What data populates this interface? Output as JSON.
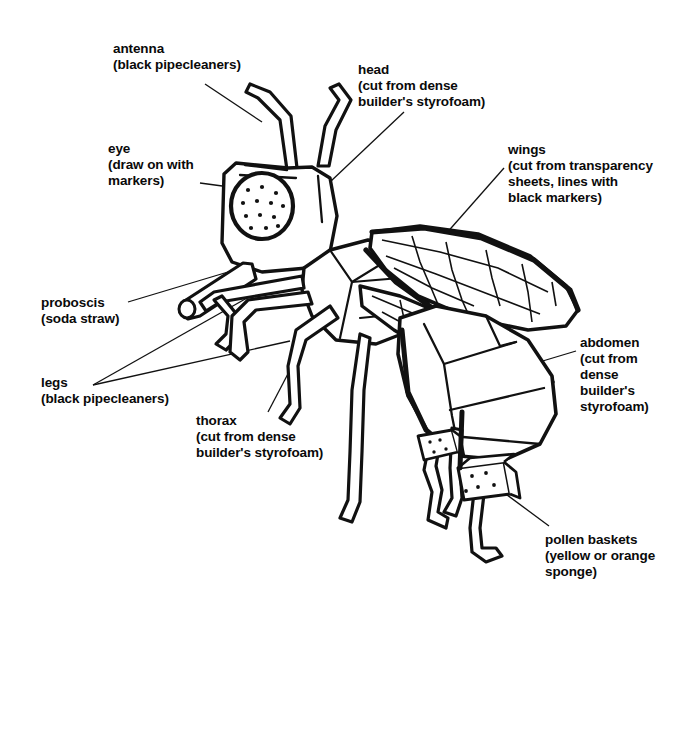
{
  "page": {
    "background_color": "#ffffff",
    "ink_color": "#111111"
  },
  "labels": [
    {
      "id": "antenna",
      "name": "antenna",
      "text": "antenna\n(black pipecleaners)"
    },
    {
      "id": "head",
      "name": "head",
      "text": "head\n(cut from dense\nbuilder's styrofoam)"
    },
    {
      "id": "eye",
      "name": "eye",
      "text": "eye\n(draw on with\nmarkers)"
    },
    {
      "id": "wings",
      "name": "wings",
      "text": "wings\n(cut from transparency\nsheets, lines with\nblack markers)"
    },
    {
      "id": "proboscis",
      "name": "proboscis",
      "text": "proboscis\n(soda straw)"
    },
    {
      "id": "legs",
      "name": "legs",
      "text": "legs\n(black pipecleaners)"
    },
    {
      "id": "thorax",
      "name": "thorax",
      "text": "thorax\n(cut from dense\nbuilder's styrofoam)"
    },
    {
      "id": "abdomen",
      "name": "abdomen",
      "text": "abdomen\n(cut from\ndense\nbuilder's\nstyrofoam)"
    },
    {
      "id": "pollen_baskets",
      "name": "pollen baskets",
      "text": "pollen baskets\n(yellow or orange\nsponge)"
    }
  ]
}
